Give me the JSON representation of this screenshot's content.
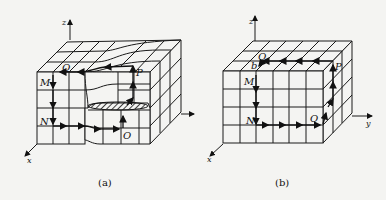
{
  "figure": {
    "panels": [
      {
        "id": "a",
        "caption": "(a)",
        "axes": {
          "x": "x",
          "y": "y",
          "z": "z"
        },
        "points": {
          "M": "M",
          "N": "N",
          "O": "O",
          "P": "P",
          "Q": "Q"
        },
        "description": "Deformed 3D grid with hatched cross-section; closed loop M→N→O→P→Q→M"
      },
      {
        "id": "b",
        "caption": "(b)",
        "axes": {
          "x": "x",
          "y": "y",
          "z": "z"
        },
        "points": {
          "M": "M",
          "N": "N",
          "O": "O",
          "P": "P",
          "Q": "Q",
          "b": "b"
        },
        "description": "Regular 3D grid 6x4x3; closed loop M→N→O→P→Q→b→M"
      }
    ]
  }
}
